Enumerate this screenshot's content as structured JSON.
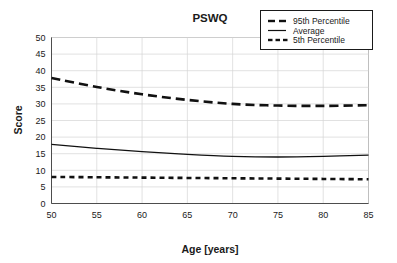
{
  "chart_data": {
    "type": "line",
    "title": "PSWQ",
    "xlabel": "Age [years]",
    "ylabel": "Score",
    "xlim": [
      50,
      85
    ],
    "ylim": [
      0,
      50
    ],
    "xticks": [
      50,
      55,
      60,
      65,
      70,
      75,
      80,
      85
    ],
    "yticks": [
      0,
      5,
      10,
      15,
      20,
      25,
      30,
      35,
      40,
      45,
      50
    ],
    "grid": true,
    "legend_position": "top-right",
    "x": [
      50,
      55,
      60,
      65,
      70,
      75,
      80,
      85
    ],
    "series": [
      {
        "name": "95th Percentile",
        "style": "dashed",
        "color": "#111111",
        "values": [
          37.8,
          35.1,
          32.9,
          31.2,
          30.0,
          29.5,
          29.4,
          29.6
        ]
      },
      {
        "name": "Average",
        "style": "solid",
        "color": "#111111",
        "values": [
          17.8,
          16.6,
          15.6,
          14.8,
          14.2,
          14.0,
          14.2,
          14.6
        ]
      },
      {
        "name": "5th Percentile",
        "style": "dotted-dash",
        "color": "#111111",
        "values": [
          8.0,
          7.9,
          7.8,
          7.7,
          7.6,
          7.5,
          7.4,
          7.3
        ]
      }
    ]
  },
  "legend": {
    "items": [
      {
        "label": "95th Percentile"
      },
      {
        "label": "Average"
      },
      {
        "label": "5th Percentile"
      }
    ]
  },
  "axes": {
    "x_tick_labels": [
      "50",
      "55",
      "60",
      "65",
      "70",
      "75",
      "80",
      "85"
    ],
    "y_tick_labels": [
      "0",
      "5",
      "10",
      "15",
      "20",
      "25",
      "30",
      "35",
      "40",
      "45",
      "50"
    ]
  },
  "colors": {
    "line": "#111111",
    "grid": "#d4d4d4",
    "frame": "#b0b0b0",
    "text": "#1a1a1a",
    "background": "#ffffff"
  }
}
